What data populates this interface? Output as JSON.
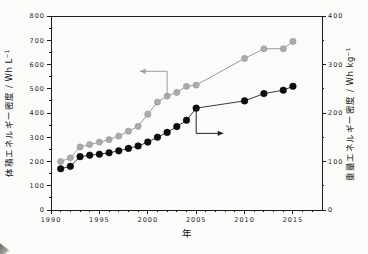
{
  "figure": {
    "xlabel": "年",
    "ylabel_left": "体積エネルギー密度 / Wh L⁻¹",
    "ylabel_right": "重量エネルギー密度 / Wh kg⁻¹"
  },
  "chart_data": {
    "type": "line",
    "title": "",
    "xlabel": "年",
    "ylabel_left": "体積エネルギー密度 / Wh L⁻¹",
    "ylabel_right": "重量エネルギー密度 / Wh kg⁻¹",
    "xlim": [
      1990,
      2018
    ],
    "ylim_left": [
      0,
      800
    ],
    "ylim_right": [
      0,
      400
    ],
    "x_ticks": [
      1990,
      1995,
      2000,
      2005,
      2010,
      2015
    ],
    "x_minor_step": 1,
    "y_ticks_left": [
      0,
      100,
      200,
      300,
      400,
      500,
      600,
      700,
      800
    ],
    "y_minor_left": 50,
    "y_ticks_right": [
      0,
      100,
      200,
      300,
      400
    ],
    "y_minor_right": 50,
    "grid": false,
    "legend": "none",
    "series": [
      {
        "name": "volumetric-energy-density",
        "label": "体積エネルギー密度",
        "axis": "left",
        "unit": "Wh L⁻¹",
        "line_color": "#9c9c9a",
        "marker_color": "#ababa9",
        "marker_edge": "#8e8e8c",
        "marker_radius": 3.1,
        "x": [
          1991,
          1992,
          1993,
          1994,
          1995,
          1996,
          1997,
          1998,
          1999,
          2000,
          2001,
          2002,
          2003,
          2004,
          2005,
          2010,
          2012,
          2014,
          2015
        ],
        "y": [
          200,
          215,
          260,
          270,
          280,
          290,
          305,
          325,
          345,
          395,
          445,
          470,
          485,
          510,
          515,
          625,
          665,
          665,
          695
        ]
      },
      {
        "name": "gravimetric-energy-density",
        "label": "重量エネルギー密度",
        "axis": "right",
        "unit": "Wh kg⁻¹",
        "line_color": "#3a3a3a",
        "marker_color": "#0d0d0d",
        "marker_edge": "#000000",
        "marker_radius": 3.3,
        "x": [
          1991,
          1992,
          1993,
          1994,
          1995,
          1996,
          1997,
          1998,
          1999,
          2000,
          2001,
          2002,
          2003,
          2004,
          2005,
          2010,
          2012,
          2014,
          2015
        ],
        "y": [
          85,
          90,
          110,
          113,
          115,
          118,
          122,
          127,
          132,
          140,
          150,
          160,
          172,
          185,
          210,
          225,
          240,
          247,
          255
        ]
      }
    ],
    "annotations": [
      {
        "name": "volumetric-arrow",
        "axis": "left",
        "color": "#9c9c9a",
        "points_x": [
          2002,
          2002,
          1999.2
        ],
        "points_y": [
          470,
          572,
          572
        ],
        "head": "end"
      },
      {
        "name": "gravimetric-arrow",
        "axis": "right",
        "color": "#222222",
        "points_x": [
          2005,
          2005,
          2007.8
        ],
        "points_y": [
          210,
          158,
          158
        ],
        "head": "end"
      }
    ]
  }
}
